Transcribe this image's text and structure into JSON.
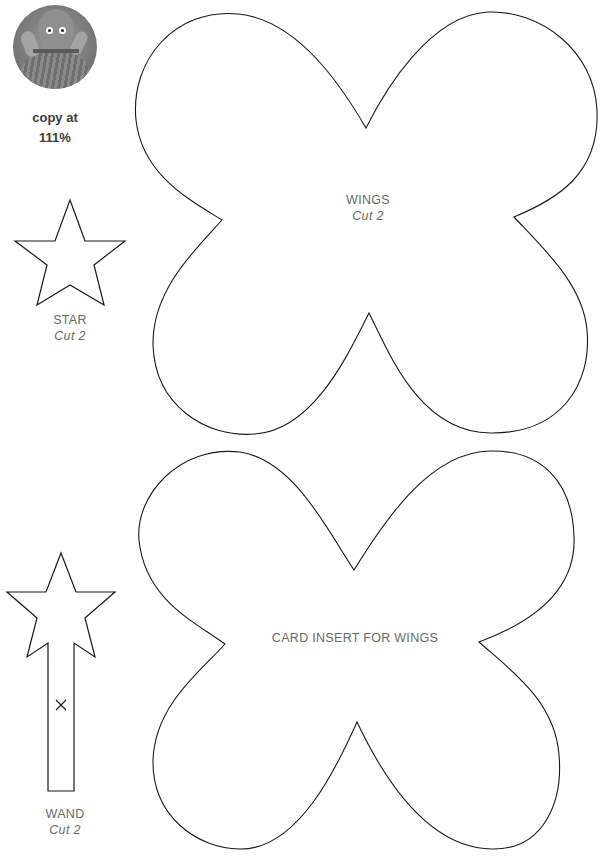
{
  "header": {
    "copy_note_line1": "copy at",
    "copy_note_line2": "111%"
  },
  "photo": {
    "alt": "knitted doll in dress",
    "icon": "photo-thumbnail"
  },
  "templates": [
    {
      "id": "star",
      "name": "STAR",
      "instruction": "Cut 2"
    },
    {
      "id": "wand",
      "name": "WAND",
      "instruction": "Cut 2",
      "mark": "×"
    },
    {
      "id": "wings",
      "name": "WINGS",
      "instruction": "Cut 2"
    },
    {
      "id": "card-insert",
      "name": "CARD INSERT FOR WINGS"
    }
  ],
  "colors": {
    "outline": "#1a1a1a",
    "label": "#6a6a6a",
    "note": "#3b3b3b"
  }
}
